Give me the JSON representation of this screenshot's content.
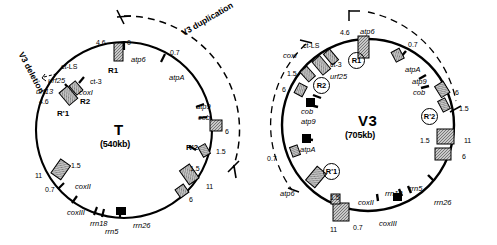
{
  "figure": {
    "type": "circular-genome-map-pair",
    "background": "#ffffff",
    "ink": "#000000",
    "box_fill": "#b0b0b0"
  },
  "maps": [
    {
      "id": "T",
      "title": "T",
      "size_label": "(540kb)",
      "cx": 124,
      "cy": 130,
      "r": 88,
      "arc_label": "V3 duplication",
      "arc_label2": "V3 deletion",
      "features": [
        {
          "name": "4.6",
          "kind": "num",
          "x": 96,
          "y": 39
        },
        {
          "name": "0",
          "kind": "num",
          "x": 127,
          "y": 39
        },
        {
          "name": "atp6",
          "kind": "gene",
          "x": 131,
          "y": 56
        },
        {
          "name": "R1",
          "kind": "rep",
          "x": 108,
          "y": 67
        },
        {
          "name": "0.7",
          "kind": "num",
          "x": 170,
          "y": 49
        },
        {
          "name": "atpA",
          "kind": "gene",
          "x": 169,
          "y": 74
        },
        {
          "name": "atp9",
          "kind": "gene",
          "x": 196,
          "y": 103
        },
        {
          "name": "cob",
          "kind": "gene",
          "x": 198,
          "y": 114
        },
        {
          "name": "6",
          "kind": "num",
          "x": 225,
          "y": 128
        },
        {
          "name": "R'2",
          "kind": "rep",
          "x": 186,
          "y": 144
        },
        {
          "name": "1.5",
          "kind": "num",
          "x": 216,
          "y": 148
        },
        {
          "name": "1.5",
          "kind": "num",
          "x": 190,
          "y": 165
        },
        {
          "name": "11",
          "kind": "num",
          "x": 206,
          "y": 183
        },
        {
          "name": "6",
          "kind": "num",
          "x": 189,
          "y": 196
        },
        {
          "name": "rrn26",
          "kind": "gene",
          "x": 133,
          "y": 222
        },
        {
          "name": "rrn5",
          "kind": "gene",
          "x": 105,
          "y": 228
        },
        {
          "name": "rrn18",
          "kind": "gene",
          "x": 90,
          "y": 220
        },
        {
          "name": "coxIII",
          "kind": "gene",
          "x": 67,
          "y": 209
        },
        {
          "name": "coxII",
          "kind": "gene",
          "x": 75,
          "y": 183
        },
        {
          "name": "0.7",
          "kind": "num",
          "x": 45,
          "y": 186
        },
        {
          "name": "11",
          "kind": "num",
          "x": 35,
          "y": 172
        },
        {
          "name": "1.5",
          "kind": "num",
          "x": 71,
          "y": 162
        },
        {
          "name": "R'1",
          "kind": "rep",
          "x": 57,
          "y": 110
        },
        {
          "name": "4.6",
          "kind": "num",
          "x": 39,
          "y": 98
        },
        {
          "name": "R2",
          "kind": "rep",
          "x": 80,
          "y": 98
        },
        {
          "name": "coxI",
          "kind": "gene",
          "x": 79,
          "y": 89
        },
        {
          "name": "urf13",
          "kind": "gene",
          "x": 36,
          "y": 88
        },
        {
          "name": "urf25",
          "kind": "gene",
          "x": 48,
          "y": 77
        },
        {
          "name": "ct-LS",
          "kind": "sm",
          "x": 61,
          "y": 63
        },
        {
          "name": "ct-3",
          "kind": "sm",
          "x": 90,
          "y": 78
        }
      ]
    },
    {
      "id": "V3",
      "title": "V3",
      "size_label": "(705kb)",
      "cx": 368,
      "cy": 125,
      "r": 86,
      "features": [
        {
          "name": "4.6",
          "kind": "num",
          "x": 340,
          "y": 29
        },
        {
          "name": "atp6",
          "kind": "gene",
          "x": 360,
          "y": 28
        },
        {
          "name": "R1",
          "kind": "cir",
          "x": 355,
          "y": 59
        },
        {
          "name": "0.7",
          "kind": "num",
          "x": 408,
          "y": 41
        },
        {
          "name": "atpA",
          "kind": "gene",
          "x": 405,
          "y": 66
        },
        {
          "name": "atp9",
          "kind": "gene",
          "x": 412,
          "y": 78
        },
        {
          "name": "cob",
          "kind": "gene",
          "x": 413,
          "y": 89
        },
        {
          "name": "6",
          "kind": "num",
          "x": 455,
          "y": 89
        },
        {
          "name": "1.5",
          "kind": "num",
          "x": 459,
          "y": 105
        },
        {
          "name": "R'2",
          "kind": "cir",
          "x": 428,
          "y": 115
        },
        {
          "name": "1.5",
          "kind": "num",
          "x": 420,
          "y": 137
        },
        {
          "name": "11",
          "kind": "num",
          "x": 464,
          "y": 137
        },
        {
          "name": "6",
          "kind": "num",
          "x": 462,
          "y": 153
        },
        {
          "name": "rrn26",
          "kind": "gene",
          "x": 434,
          "y": 199
        },
        {
          "name": "rrn5",
          "kind": "gene",
          "x": 409,
          "y": 185
        },
        {
          "name": "rrn18",
          "kind": "gene",
          "x": 385,
          "y": 190
        },
        {
          "name": "coxIII",
          "kind": "gene",
          "x": 379,
          "y": 220
        },
        {
          "name": "coxII",
          "kind": "gene",
          "x": 358,
          "y": 199
        },
        {
          "name": "0.7",
          "kind": "num",
          "x": 353,
          "y": 224
        },
        {
          "name": "11",
          "kind": "num",
          "x": 330,
          "y": 226
        },
        {
          "name": "1.5",
          "kind": "num",
          "x": 330,
          "y": 194
        },
        {
          "name": "R'1",
          "kind": "cir",
          "x": 330,
          "y": 170
        },
        {
          "name": "atp6",
          "kind": "gene",
          "x": 280,
          "y": 190
        },
        {
          "name": "0.7",
          "kind": "num",
          "x": 267,
          "y": 155
        },
        {
          "name": "atpA",
          "kind": "gene",
          "x": 300,
          "y": 146
        },
        {
          "name": "atp9",
          "kind": "gene",
          "x": 301,
          "y": 118
        },
        {
          "name": "cob",
          "kind": "gene",
          "x": 301,
          "y": 108
        },
        {
          "name": "6",
          "kind": "num",
          "x": 282,
          "y": 86
        },
        {
          "name": "1.5",
          "kind": "num",
          "x": 287,
          "y": 70
        },
        {
          "name": "R2",
          "kind": "cir",
          "x": 320,
          "y": 84
        },
        {
          "name": "urf25",
          "kind": "gene",
          "x": 330,
          "y": 73
        },
        {
          "name": "ct-3",
          "kind": "sm",
          "x": 330,
          "y": 61
        },
        {
          "name": "ct-LS",
          "kind": "sm",
          "x": 303,
          "y": 42
        },
        {
          "name": "coxI",
          "kind": "gene",
          "x": 283,
          "y": 52
        }
      ]
    }
  ]
}
